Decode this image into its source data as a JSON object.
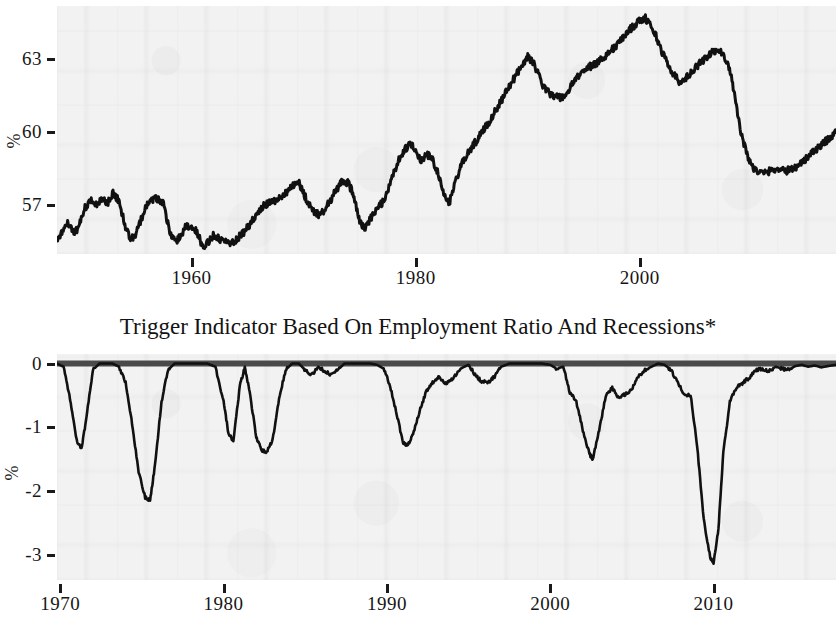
{
  "figure": {
    "background_color": "#ffffff",
    "plot_background_color": "#f2f2f2",
    "line_color": "#111111",
    "zero_line_color": "#4a4a4a"
  },
  "panels": [
    {
      "id": "employment-ratio",
      "title": "",
      "y_axis_label": "%",
      "x_axis_label": ""
    },
    {
      "id": "trigger-indicator",
      "title": "Trigger Indicator Based On Employment Ratio And Recessions*",
      "y_axis_label": "%",
      "x_axis_label": ""
    }
  ],
  "chart_data": [
    {
      "type": "line",
      "title": "",
      "xlabel": "",
      "ylabel": "%",
      "xlim": [
        1948.0,
        2017.5
      ],
      "ylim": [
        55.0,
        65.2
      ],
      "xticks": [
        1960,
        1980,
        2000
      ],
      "xtick_labels": [
        "1960",
        "1980",
        "2000"
      ],
      "yticks": [
        57,
        60,
        63
      ],
      "ytick_labels": [
        "57",
        "60",
        "63"
      ],
      "grid": false,
      "legend": "none",
      "series": [
        {
          "name": "Employment Ratio",
          "x": [
            1948.0,
            1948.5,
            1949.0,
            1949.5,
            1950.0,
            1950.5,
            1951.0,
            1951.5,
            1952.0,
            1952.5,
            1953.0,
            1953.5,
            1954.0,
            1954.5,
            1955.0,
            1955.5,
            1956.0,
            1956.5,
            1957.0,
            1957.5,
            1958.0,
            1958.5,
            1959.0,
            1959.5,
            1960.0,
            1960.5,
            1961.0,
            1961.5,
            1962.0,
            1962.5,
            1963.0,
            1963.5,
            1964.0,
            1964.5,
            1965.0,
            1965.5,
            1966.0,
            1966.5,
            1967.0,
            1967.5,
            1968.0,
            1968.5,
            1969.0,
            1969.5,
            1970.0,
            1970.5,
            1971.0,
            1971.5,
            1972.0,
            1972.5,
            1973.0,
            1973.5,
            1974.0,
            1974.5,
            1975.0,
            1975.5,
            1976.0,
            1976.5,
            1977.0,
            1977.5,
            1978.0,
            1978.5,
            1979.0,
            1979.5,
            1980.0,
            1980.5,
            1981.0,
            1981.5,
            1982.0,
            1982.5,
            1983.0,
            1983.5,
            1984.0,
            1984.5,
            1985.0,
            1985.5,
            1986.0,
            1986.5,
            1987.0,
            1987.5,
            1988.0,
            1988.5,
            1989.0,
            1989.5,
            1990.0,
            1990.5,
            1991.0,
            1991.5,
            1992.0,
            1992.5,
            1993.0,
            1993.5,
            1994.0,
            1994.5,
            1995.0,
            1995.5,
            1996.0,
            1996.5,
            1997.0,
            1997.5,
            1998.0,
            1998.5,
            1999.0,
            1999.5,
            2000.0,
            2000.5,
            2001.0,
            2001.5,
            2002.0,
            2002.5,
            2003.0,
            2003.5,
            2004.0,
            2004.5,
            2005.0,
            2005.5,
            2006.0,
            2006.5,
            2007.0,
            2007.5,
            2008.0,
            2008.5,
            2009.0,
            2009.5,
            2010.0,
            2010.5,
            2011.0,
            2011.5,
            2012.0,
            2012.5,
            2013.0,
            2013.5,
            2014.0,
            2014.5,
            2015.0,
            2015.5,
            2016.0,
            2016.5,
            2017.0,
            2017.5
          ],
          "y": [
            55.5,
            56.0,
            56.3,
            55.8,
            56.2,
            56.9,
            57.2,
            57.0,
            57.3,
            57.1,
            57.5,
            57.2,
            56.3,
            55.6,
            55.8,
            56.4,
            57.0,
            57.2,
            57.3,
            57.1,
            56.0,
            55.5,
            55.7,
            56.2,
            56.1,
            55.9,
            55.3,
            55.5,
            55.8,
            55.6,
            55.5,
            55.4,
            55.6,
            55.8,
            56.1,
            56.4,
            56.8,
            57.0,
            57.1,
            57.2,
            57.4,
            57.5,
            57.8,
            58.0,
            57.5,
            57.0,
            56.7,
            56.6,
            56.9,
            57.3,
            57.7,
            58.0,
            57.9,
            57.4,
            56.3,
            56.1,
            56.5,
            56.8,
            57.1,
            57.6,
            58.3,
            58.9,
            59.3,
            59.5,
            59.3,
            58.8,
            59.1,
            58.9,
            58.3,
            57.4,
            57.1,
            57.9,
            58.6,
            59.0,
            59.4,
            59.7,
            60.1,
            60.4,
            60.8,
            61.2,
            61.6,
            62.0,
            62.4,
            62.8,
            63.1,
            62.9,
            62.3,
            61.8,
            61.6,
            61.5,
            61.4,
            61.6,
            62.0,
            62.3,
            62.6,
            62.7,
            62.8,
            63.0,
            63.2,
            63.4,
            63.6,
            63.9,
            64.2,
            64.4,
            64.6,
            64.7,
            64.4,
            63.9,
            63.3,
            62.8,
            62.4,
            62.1,
            62.2,
            62.4,
            62.7,
            62.9,
            63.1,
            63.3,
            63.4,
            63.2,
            62.6,
            61.5,
            60.0,
            59.2,
            58.6,
            58.4,
            58.3,
            58.4,
            58.5,
            58.5,
            58.4,
            58.5,
            58.6,
            58.8,
            59.0,
            59.2,
            59.4,
            59.6,
            59.8,
            60.0,
            60.2,
            60.4,
            60.5,
            60.6
          ]
        }
      ],
      "annotations": [
        {
          "text": "series begins 1948, high-frequency monthly noise overlaid on trend"
        },
        {
          "text": "peak near 64.7 around year 2000"
        },
        {
          "text": "sharp decline during 2008-2009 to near 58.3"
        }
      ]
    },
    {
      "type": "line",
      "title": "Trigger Indicator Based On Employment Ratio And Recessions*",
      "xlabel": "",
      "ylabel": "%",
      "xlim": [
        1969.8,
        2017.5
      ],
      "ylim": [
        -3.4,
        0.15
      ],
      "xticks": [
        1970,
        1980,
        1990,
        2000,
        2010
      ],
      "xtick_labels": [
        "1970",
        "1980",
        "1990",
        "2000",
        "2010"
      ],
      "yticks": [
        0,
        -1,
        -2,
        -3
      ],
      "ytick_labels": [
        "0",
        "-1",
        "-2",
        "-3"
      ],
      "grid": false,
      "legend": "none",
      "zero_reference_line": 0,
      "series": [
        {
          "name": "Trigger Indicator",
          "x": [
            1969.8,
            1970.2,
            1970.6,
            1971.0,
            1971.3,
            1971.6,
            1972.0,
            1972.4,
            1972.8,
            1973.2,
            1973.6,
            1974.0,
            1974.4,
            1974.8,
            1975.2,
            1975.5,
            1975.8,
            1976.2,
            1976.6,
            1977.0,
            1977.5,
            1978.0,
            1978.5,
            1979.0,
            1979.5,
            1980.0,
            1980.3,
            1980.6,
            1981.0,
            1981.3,
            1981.6,
            1982.0,
            1982.3,
            1982.6,
            1983.0,
            1983.4,
            1983.8,
            1984.2,
            1984.6,
            1985.0,
            1985.4,
            1985.8,
            1986.2,
            1986.6,
            1987.0,
            1987.4,
            1987.8,
            1988.2,
            1988.6,
            1989.0,
            1989.4,
            1989.8,
            1990.2,
            1990.6,
            1991.0,
            1991.3,
            1991.6,
            1992.0,
            1992.4,
            1992.8,
            1993.2,
            1993.6,
            1994.0,
            1994.5,
            1995.0,
            1995.4,
            1995.8,
            1996.2,
            1996.6,
            1997.0,
            1997.5,
            1998.0,
            1998.5,
            1999.0,
            1999.5,
            2000.0,
            2000.4,
            2000.8,
            2001.2,
            2001.6,
            2002.0,
            2002.4,
            2002.6,
            2003.0,
            2003.4,
            2003.8,
            2004.2,
            2004.6,
            2005.0,
            2005.4,
            2005.8,
            2006.2,
            2006.6,
            2007.0,
            2007.4,
            2007.8,
            2008.2,
            2008.6,
            2009.0,
            2009.4,
            2009.8,
            2010.0,
            2010.3,
            2010.6,
            2011.0,
            2011.4,
            2011.8,
            2012.2,
            2012.6,
            2013.0,
            2013.4,
            2013.8,
            2014.2,
            2014.6,
            2015.0,
            2015.4,
            2015.8,
            2016.2,
            2016.6,
            2017.0,
            2017.5
          ],
          "y": [
            0.0,
            -0.05,
            -0.55,
            -1.2,
            -1.35,
            -0.85,
            -0.1,
            0.0,
            0.0,
            0.0,
            -0.05,
            -0.3,
            -0.95,
            -1.7,
            -2.1,
            -2.15,
            -1.6,
            -0.6,
            -0.1,
            0.0,
            0.0,
            0.0,
            0.0,
            0.0,
            -0.05,
            -0.6,
            -1.1,
            -1.22,
            -0.35,
            -0.05,
            -0.45,
            -1.15,
            -1.35,
            -1.4,
            -1.2,
            -0.55,
            -0.1,
            0.0,
            0.0,
            -0.1,
            -0.18,
            -0.05,
            -0.12,
            -0.18,
            -0.1,
            0.0,
            0.0,
            0.0,
            0.0,
            0.0,
            -0.02,
            -0.08,
            -0.35,
            -0.8,
            -1.25,
            -1.28,
            -1.1,
            -0.75,
            -0.45,
            -0.3,
            -0.2,
            -0.32,
            -0.25,
            -0.08,
            -0.02,
            -0.18,
            -0.28,
            -0.3,
            -0.2,
            -0.05,
            0.0,
            0.0,
            0.0,
            0.0,
            0.0,
            -0.02,
            -0.08,
            -0.05,
            -0.45,
            -0.6,
            -1.05,
            -1.42,
            -1.5,
            -1.05,
            -0.5,
            -0.38,
            -0.55,
            -0.48,
            -0.4,
            -0.2,
            -0.1,
            -0.05,
            0.0,
            -0.02,
            -0.1,
            -0.3,
            -0.48,
            -0.5,
            -1.3,
            -2.45,
            -3.05,
            -3.15,
            -2.6,
            -1.4,
            -0.6,
            -0.38,
            -0.3,
            -0.22,
            -0.1,
            -0.08,
            -0.12,
            -0.05,
            -0.08,
            -0.1,
            -0.04,
            -0.02,
            -0.05,
            -0.03,
            -0.06,
            -0.04,
            -0.02
          ]
        }
      ],
      "annotations": [
        {
          "text": "deepest trough near -3.15 during 2009-2010"
        },
        {
          "text": "secondary trough near -2.15 during 1975"
        },
        {
          "text": "thick horizontal reference line drawn at 0"
        }
      ]
    }
  ]
}
